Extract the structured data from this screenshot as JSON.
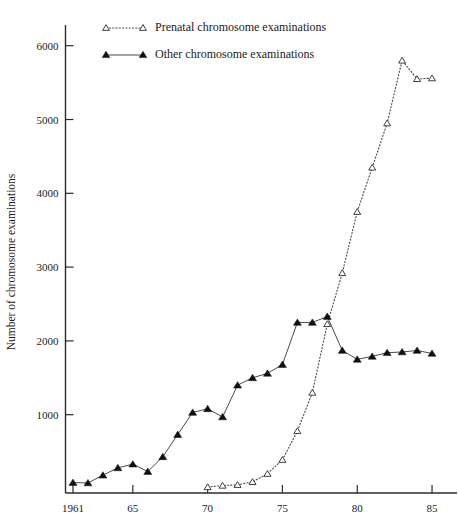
{
  "chart_data": {
    "type": "line",
    "title": "",
    "xlabel": "",
    "ylabel": "Number of chromosome examinations",
    "xlim": [
      1960.5,
      1985.8
    ],
    "ylim": [
      0,
      6450
    ],
    "grid": false,
    "legend_position": "top-center",
    "x_tick_labels": [
      "1961",
      "65",
      "70",
      "75",
      "80",
      "85"
    ],
    "x_tick_values": [
      1961,
      1965,
      1970,
      1975,
      1980,
      1985
    ],
    "y_tick_labels": [
      "1000",
      "2000",
      "3000",
      "4000",
      "5000",
      "6000"
    ],
    "y_tick_values": [
      1000,
      2000,
      3000,
      4000,
      5000,
      6000
    ],
    "x": [
      1961,
      1962,
      1963,
      1964,
      1965,
      1966,
      1967,
      1968,
      1969,
      1970,
      1971,
      1972,
      1973,
      1974,
      1975,
      1976,
      1977,
      1978,
      1979,
      1980,
      1981,
      1982,
      1983,
      1984,
      1985
    ],
    "series": [
      {
        "name": "Prenatal chromosome examinations",
        "marker": "open-triangle",
        "linestyle": "dotted",
        "x": [
          1970,
          1971,
          1972,
          1973,
          1974,
          1975,
          1976,
          1977,
          1978,
          1979,
          1980,
          1981,
          1982,
          1983,
          1984,
          1985
        ],
        "values": [
          20,
          40,
          50,
          90,
          200,
          390,
          780,
          1300,
          2230,
          2920,
          3750,
          4350,
          4950,
          5800,
          5550,
          5560
        ]
      },
      {
        "name": "Other chromosome examinations",
        "marker": "filled-triangle",
        "linestyle": "solid",
        "x": [
          1961,
          1962,
          1963,
          1964,
          1965,
          1966,
          1967,
          1968,
          1969,
          1970,
          1971,
          1972,
          1973,
          1974,
          1975,
          1976,
          1977,
          1978,
          1979,
          1980,
          1981,
          1982,
          1983,
          1984,
          1985
        ],
        "values": [
          80,
          75,
          180,
          280,
          330,
          230,
          430,
          730,
          1030,
          1080,
          970,
          1400,
          1500,
          1560,
          1680,
          2250,
          2250,
          2330,
          1870,
          1750,
          1790,
          1840,
          1850,
          1870,
          1830
        ]
      }
    ]
  },
  "legend": {
    "items": [
      {
        "label": "Prenatal chromosome examinations",
        "marker": "open-triangle",
        "linestyle": "dotted"
      },
      {
        "label": "Other chromosome examinations",
        "marker": "filled-triangle",
        "linestyle": "solid"
      }
    ]
  },
  "axes": {
    "y_title": "Number of chromosome examinations"
  }
}
